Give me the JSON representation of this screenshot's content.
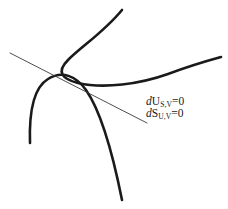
{
  "figure": {
    "title": "",
    "background_color": "#ffffff",
    "curve_color": "#1a1a1a",
    "tangent_color": "#3a3a3a",
    "labels": [
      {
        "id": "du-label",
        "differential": "d",
        "variable": "U",
        "subscript": "S,V",
        "relation": "=0",
        "plain": "dU_{S,V}=0"
      },
      {
        "id": "ds-label",
        "differential": "d",
        "variable": "S",
        "subscript": "U,V",
        "relation": "=0",
        "plain": "dS_{U,V}=0"
      }
    ]
  },
  "chart_data": {
    "type": "line",
    "title": "",
    "xlabel": "",
    "ylabel": "",
    "grid": false,
    "legend": "none",
    "xlim": [
      0,
      228
    ],
    "ylim": [
      209,
      0
    ],
    "annotations": [
      {
        "text": "dU_{S,V}=0",
        "x": 146,
        "y": 101
      },
      {
        "text": "dS_{U,V}=0",
        "x": 146,
        "y": 113
      }
    ],
    "series": [
      {
        "name": "energy-surface-curve",
        "style": "thick",
        "path": "M 122 10 C 104 32, 82 46, 68 60 C 56 72, 62 79, 78 83 C 104 89, 140 84, 168 74 C 192 65, 210 60, 221 57",
        "points": [
          [
            122,
            10
          ],
          [
            104,
            32
          ],
          [
            82,
            46
          ],
          [
            68,
            60
          ],
          [
            56,
            72
          ],
          [
            62,
            79
          ],
          [
            78,
            83
          ],
          [
            104,
            89
          ],
          [
            140,
            84
          ],
          [
            168,
            74
          ],
          [
            192,
            65
          ],
          [
            210,
            60
          ],
          [
            221,
            57
          ]
        ]
      },
      {
        "name": "entropy-surface-curve",
        "style": "thick",
        "path": "M 30 143 C 29 112, 33 88, 48 79 C 62 70, 76 76, 86 90 C 100 110, 112 150, 122 200",
        "points": [
          [
            30,
            143
          ],
          [
            29,
            112
          ],
          [
            33,
            88
          ],
          [
            48,
            79
          ],
          [
            62,
            70
          ],
          [
            76,
            76
          ],
          [
            86,
            90
          ],
          [
            100,
            110
          ],
          [
            112,
            150
          ],
          [
            122,
            200
          ]
        ]
      },
      {
        "name": "common-tangent-line",
        "style": "thin",
        "path": "M 10 53 L 147 123",
        "points": [
          [
            10,
            53
          ],
          [
            147,
            123
          ]
        ]
      }
    ]
  }
}
